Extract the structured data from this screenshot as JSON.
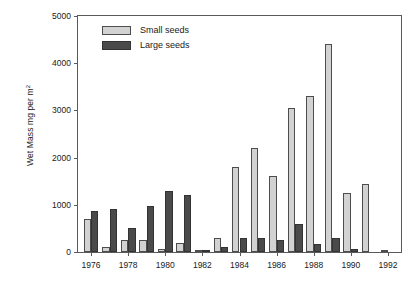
{
  "chart_data": {
    "type": "bar",
    "title": "",
    "xlabel": "",
    "ylabel": "Wet Mass mg per m2",
    "ylabel_text": "Wet Mass mg per m",
    "ylabel_sup": "2",
    "ylim": [
      0,
      5000
    ],
    "xlim": [
      1975.3,
      1992.7
    ],
    "grid": false,
    "legend_position": "top-left",
    "y_ticks": [
      0,
      1000,
      2000,
      3000,
      4000,
      5000
    ],
    "y_tick_labels": [
      "0",
      "1000",
      "2000",
      "3000",
      "4000",
      "5000"
    ],
    "x_ticks": [
      1976,
      1978,
      1980,
      1982,
      1984,
      1986,
      1988,
      1990,
      1992
    ],
    "x_tick_labels": [
      "1976",
      "1978",
      "1980",
      "1982",
      "1984",
      "1986",
      "1988",
      "1990",
      "1992"
    ],
    "categories": [
      1976,
      1977,
      1978,
      1979,
      1980,
      1981,
      1982,
      1983,
      1984,
      1985,
      1986,
      1987,
      1988,
      1989,
      1990,
      1991,
      1992
    ],
    "series": [
      {
        "name": "Small seeds",
        "color": "#d2d2d2",
        "values": [
          700,
          100,
          250,
          265,
          55,
          200,
          30,
          300,
          1800,
          2200,
          1610,
          3050,
          3300,
          4400,
          1250,
          1450,
          10
        ]
      },
      {
        "name": "Large seeds",
        "color": "#4a4a4a",
        "values": [
          860,
          905,
          500,
          975,
          1300,
          1200,
          50,
          100,
          300,
          295,
          250,
          600,
          175,
          295,
          55,
          0,
          0
        ]
      }
    ]
  },
  "legend": {
    "items": [
      {
        "label": "Small seeds",
        "key": "small"
      },
      {
        "label": "Large seeds",
        "key": "large"
      }
    ]
  }
}
